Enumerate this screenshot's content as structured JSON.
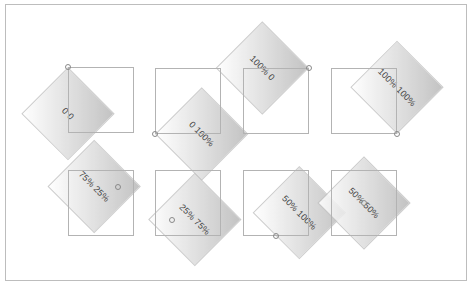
{
  "diagram": {
    "title": "",
    "box_size": 66,
    "rotation_deg": 45,
    "items": [
      {
        "label": "0 0",
        "origin": "0 0",
        "ox": 0,
        "oy": 0,
        "left": 68,
        "top": 67
      },
      {
        "label": "0 100%",
        "origin": "0 100%",
        "ox": 0,
        "oy": 66,
        "left": 155,
        "top": 68
      },
      {
        "label": "100% 0",
        "origin": "100% 0",
        "ox": 66,
        "oy": 0,
        "left": 243,
        "top": 68
      },
      {
        "label": "100% 100%",
        "origin": "100% 100%",
        "ox": 66,
        "oy": 66,
        "left": 331,
        "top": 68
      },
      {
        "label": "75% 25%",
        "origin": "75% 25%",
        "ox": 49.5,
        "oy": 16.5,
        "left": 68,
        "top": 170
      },
      {
        "label": "25% 75%",
        "origin": "25% 75%",
        "ox": 16.5,
        "oy": 49.5,
        "left": 155,
        "top": 170
      },
      {
        "label": "50% 100%",
        "origin": "50% 100%",
        "ox": 33,
        "oy": 66,
        "left": 243,
        "top": 170
      },
      {
        "label": "50% 50%",
        "origin": "50% 50%",
        "ox": 33,
        "oy": 33,
        "left": 331,
        "top": 170
      }
    ]
  },
  "colors": {
    "box_border": "#b3b3b3",
    "diamond_dark": "#b9b9b9",
    "diamond_light": "#ffffff",
    "frame_border": "#bdbdbd",
    "label": "#222222"
  }
}
